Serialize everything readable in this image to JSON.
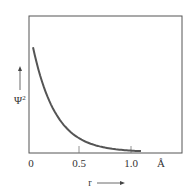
{
  "chart_data": {
    "type": "line",
    "title": "",
    "xlabel": "r",
    "ylabel": "Ψ²",
    "x_unit": "Å",
    "x_ticks": [
      "0",
      "0.5",
      "1.0"
    ],
    "xlim": [
      0,
      1.55
    ],
    "ylim": [
      0,
      1
    ],
    "grid": false,
    "legend": null,
    "series": [
      {
        "name": "Ψ²",
        "x": [
          0.02,
          0.1,
          0.2,
          0.3,
          0.4,
          0.5,
          0.6,
          0.7,
          0.8,
          0.9,
          1.0,
          1.1
        ],
        "values": [
          0.77,
          0.58,
          0.41,
          0.28,
          0.19,
          0.12,
          0.075,
          0.045,
          0.025,
          0.012,
          0.006,
          0.003
        ]
      }
    ],
    "color": "#555555"
  },
  "labels": {
    "y_axis": "Ψ",
    "y_sup": "2",
    "x_axis": "r",
    "unit": "Å",
    "tick0": "0",
    "tick1": "0.5",
    "tick2": "1.0"
  }
}
